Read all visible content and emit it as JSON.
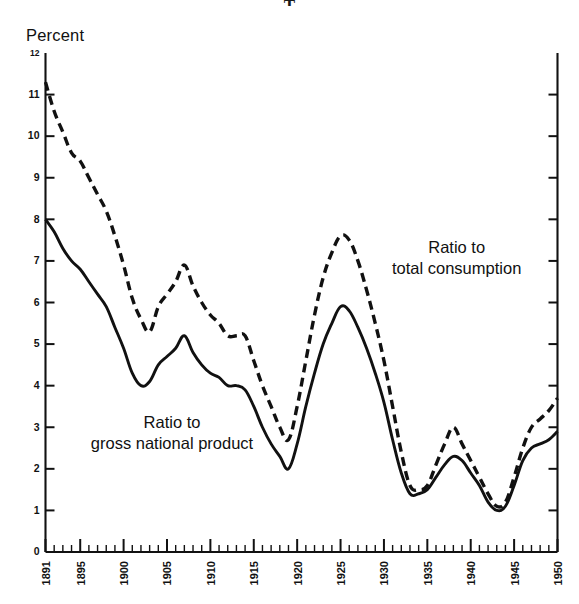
{
  "header": {
    "title_fragment": "T"
  },
  "axis": {
    "y_label": "Percent",
    "y_ticks": [
      12,
      11,
      10,
      9,
      8,
      7,
      6,
      5,
      4,
      3,
      2,
      1,
      0
    ],
    "x_ticks_major": [
      1891,
      1895,
      1900,
      1905,
      1910,
      1915,
      1920,
      1925,
      1930,
      1935,
      1940,
      1945,
      1950
    ],
    "x_min": 1891,
    "x_max": 1950,
    "y_min": 0,
    "y_max": 12
  },
  "annotations": {
    "consumption": "Ratio to\ntotal consumption",
    "gnp": "Ratio to\ngross national product"
  },
  "colors": {
    "ink": "#111111",
    "background": "#ffffff"
  },
  "chart_data": {
    "type": "line",
    "title": "",
    "subtitle": "",
    "xlabel": "",
    "ylabel": "Percent",
    "xlim": [
      1891,
      1950
    ],
    "ylim": [
      0,
      12
    ],
    "grid": false,
    "legend": "inline-annotations",
    "x": [
      1891,
      1892,
      1893,
      1894,
      1895,
      1896,
      1897,
      1898,
      1899,
      1900,
      1901,
      1902,
      1903,
      1904,
      1905,
      1906,
      1907,
      1908,
      1909,
      1910,
      1911,
      1912,
      1913,
      1914,
      1915,
      1916,
      1917,
      1918,
      1919,
      1920,
      1921,
      1922,
      1923,
      1924,
      1925,
      1926,
      1927,
      1928,
      1929,
      1930,
      1931,
      1932,
      1933,
      1934,
      1935,
      1936,
      1937,
      1938,
      1939,
      1940,
      1941,
      1942,
      1943,
      1944,
      1945,
      1946,
      1947,
      1948,
      1949,
      1950
    ],
    "series": [
      {
        "name": "Ratio to total consumption",
        "style": "dashed",
        "values": [
          11.3,
          10.6,
          10.1,
          9.6,
          9.4,
          9.0,
          8.6,
          8.2,
          7.6,
          6.9,
          6.1,
          5.6,
          5.3,
          5.9,
          6.2,
          6.5,
          6.9,
          6.4,
          6.0,
          5.7,
          5.5,
          5.2,
          5.2,
          5.2,
          4.6,
          4.0,
          3.5,
          3.0,
          2.7,
          3.5,
          4.6,
          5.7,
          6.6,
          7.2,
          7.6,
          7.5,
          7.0,
          6.3,
          5.5,
          4.6,
          3.5,
          2.4,
          1.6,
          1.5,
          1.6,
          2.1,
          2.6,
          3.0,
          2.6,
          2.2,
          1.8,
          1.4,
          1.1,
          1.2,
          1.8,
          2.5,
          3.0,
          3.2,
          3.4,
          3.7
        ]
      },
      {
        "name": "Ratio to gross national product",
        "style": "solid",
        "values": [
          8.0,
          7.7,
          7.3,
          7.0,
          6.8,
          6.5,
          6.2,
          5.9,
          5.4,
          4.9,
          4.3,
          4.0,
          4.1,
          4.5,
          4.7,
          4.9,
          5.2,
          4.8,
          4.5,
          4.3,
          4.2,
          4.0,
          4.0,
          3.9,
          3.5,
          3.0,
          2.6,
          2.3,
          2.0,
          2.6,
          3.5,
          4.3,
          5.0,
          5.5,
          5.9,
          5.8,
          5.4,
          4.9,
          4.3,
          3.6,
          2.7,
          1.9,
          1.4,
          1.4,
          1.5,
          1.8,
          2.1,
          2.3,
          2.2,
          1.9,
          1.6,
          1.2,
          1.0,
          1.1,
          1.6,
          2.2,
          2.5,
          2.6,
          2.7,
          2.9
        ]
      }
    ]
  }
}
